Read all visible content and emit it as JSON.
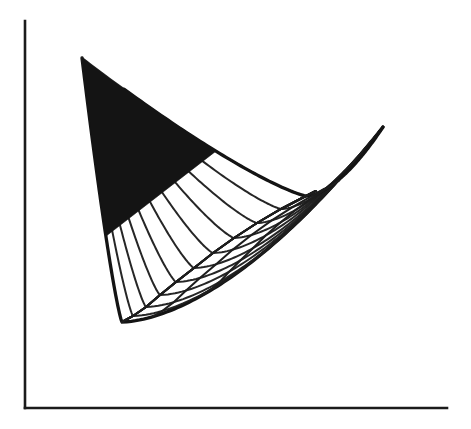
{
  "figure": {
    "kind": "line-drawing",
    "title": "",
    "caption": "",
    "background_color": "#ffffff",
    "ink_color": "#1d1d1d",
    "axis_color": "#1b1b1b",
    "envelope_color": "#141414"
  },
  "axes": {
    "y_axis": {
      "x": 25,
      "y_top": 21,
      "y_bottom": 408,
      "label": ""
    },
    "x_axis": {
      "y": 408,
      "x_left": 25,
      "x_right": 447,
      "label": ""
    },
    "show_ticks": false,
    "show_tick_labels": false,
    "show_grid": false
  },
  "chart_data": {
    "type": "line",
    "title": "",
    "subtitle": "",
    "xlabel": "",
    "ylabel": "",
    "xlim": [
      0,
      471
    ],
    "ylim": [
      429,
      0
    ],
    "grid": false,
    "legend": "none",
    "annotations": [
      {
        "name": "common-point",
        "x": 82,
        "y": 58,
        "text": ""
      },
      {
        "name": "envelope-minimum",
        "x": 122,
        "y": 322,
        "text": ""
      },
      {
        "name": "bundle-end-upper-right",
        "x": 383,
        "y": 127,
        "text": ""
      }
    ],
    "family": {
      "name": "longitudinal parabolas through common point",
      "count": 11,
      "common_point": [
        82,
        58
      ],
      "curves": [
        {
          "index": 0,
          "apex_dir": [
            0.1,
            1.0
          ],
          "vertex": [
            122,
            322
          ],
          "end": [
            383,
            127
          ]
        },
        {
          "index": 1,
          "apex_dir": [
            0.18,
            1.0
          ],
          "vertex": [
            133,
            316
          ],
          "end": [
            383,
            127
          ]
        },
        {
          "index": 2,
          "apex_dir": [
            0.26,
            1.0
          ],
          "vertex": [
            146,
            307
          ],
          "end": [
            383,
            127
          ]
        },
        {
          "index": 3,
          "apex_dir": [
            0.34,
            1.0
          ],
          "vertex": [
            160,
            295
          ],
          "end": [
            383,
            127
          ]
        },
        {
          "index": 4,
          "apex_dir": [
            0.43,
            1.0
          ],
          "vertex": [
            176,
            282
          ],
          "end": [
            383,
            127
          ]
        },
        {
          "index": 5,
          "apex_dir": [
            0.52,
            1.0
          ],
          "vertex": [
            194,
            268
          ],
          "end": [
            383,
            127
          ]
        },
        {
          "index": 6,
          "apex_dir": [
            0.62,
            1.0
          ],
          "vertex": [
            213,
            253
          ],
          "end": [
            383,
            127
          ]
        },
        {
          "index": 7,
          "apex_dir": [
            0.73,
            1.0
          ],
          "vertex": [
            234,
            238
          ],
          "end": [
            383,
            127
          ]
        },
        {
          "index": 8,
          "apex_dir": [
            0.85,
            1.0
          ],
          "vertex": [
            257,
            223
          ],
          "end": [
            383,
            127
          ]
        },
        {
          "index": 9,
          "apex_dir": [
            0.98,
            1.0
          ],
          "vertex": [
            281,
            209
          ],
          "end": [
            383,
            127
          ]
        },
        {
          "index": 10,
          "apex_dir": [
            1.12,
            1.0
          ],
          "vertex": [
            306,
            196
          ],
          "end": [
            383,
            127
          ]
        }
      ]
    },
    "transversals": {
      "name": "transversal arcs crossing the family",
      "count": 7,
      "tick_tops_x": [
        153,
        205,
        244,
        273,
        297,
        315,
        330
      ],
      "tick_tops_y": [
        193,
        197,
        199,
        200,
        199,
        197,
        193
      ]
    },
    "series": [
      {
        "name": "longitudinal family",
        "values": []
      },
      {
        "name": "transversal family",
        "values": []
      },
      {
        "name": "envelope",
        "values": []
      }
    ]
  },
  "interaction": {
    "clickable": false,
    "note": ""
  }
}
